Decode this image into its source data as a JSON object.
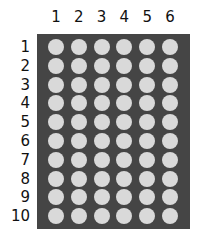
{
  "grid": {
    "columns": [
      "1",
      "2",
      "3",
      "4",
      "5",
      "6"
    ],
    "rows": [
      "1",
      "2",
      "3",
      "4",
      "5",
      "6",
      "7",
      "8",
      "9",
      "10"
    ],
    "plate_color": "#454545",
    "well_color": "#d9d9d9"
  }
}
